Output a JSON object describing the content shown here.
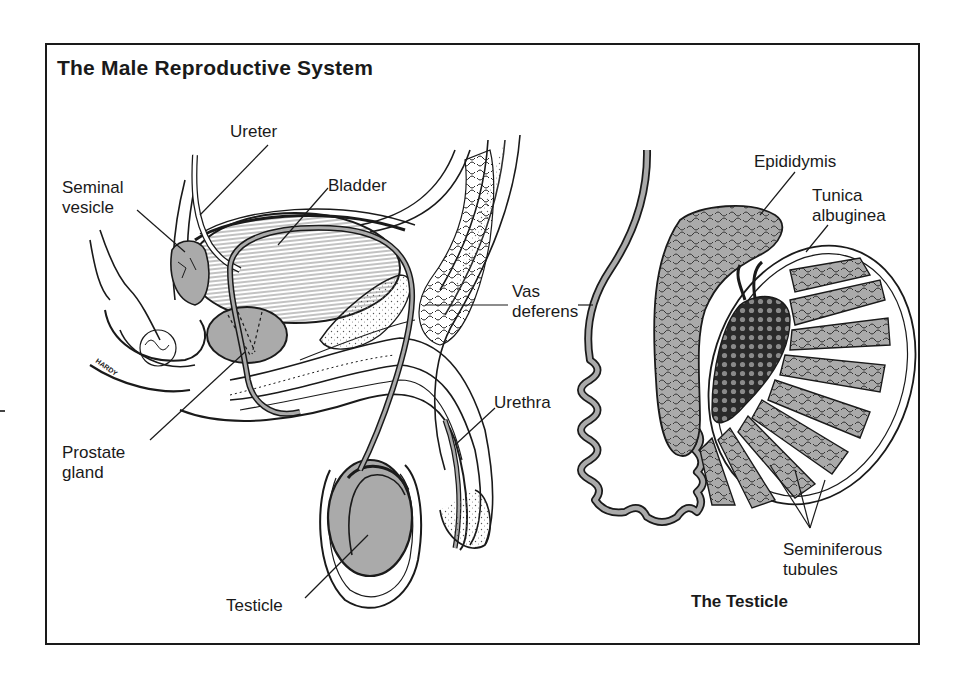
{
  "diagram": {
    "title": "The Male Reproductive System",
    "subtitle": "The Testicle",
    "artist_signature": "HARDY",
    "colors": {
      "ink": "#1a1a1a",
      "organ_fill": "#aaaaaa",
      "background": "#ffffff"
    },
    "labels": {
      "ureter": "Ureter",
      "seminal_vesicle": "Seminal\nvesicle",
      "bladder": "Bladder",
      "vas_deferens": "Vas\ndeferens",
      "urethra": "Urethra",
      "prostate_gland": "Prostate\ngland",
      "testicle": "Testicle",
      "epididymis": "Epididymis",
      "tunica_albuginea": "Tunica\nalbuginea",
      "seminiferous_tubules": "Seminiferous\ntubules"
    }
  }
}
